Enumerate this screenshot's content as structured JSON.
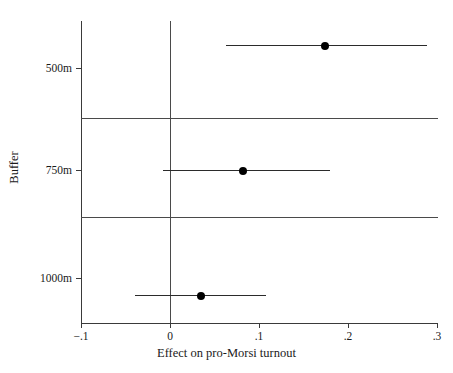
{
  "figure": {
    "cut_off_header_left": "",
    "cut_off_header_right": ""
  },
  "chart_data": {
    "type": "scatter",
    "subtype": "coefficient-plot-with-confidence-intervals",
    "orientation": "horizontal",
    "title": "",
    "xlabel": "Effect on pro-Morsi turnout",
    "ylabel": "Buffer",
    "categories": [
      "500m",
      "750m",
      "1000m"
    ],
    "xlim": [
      -0.1,
      0.3
    ],
    "xticks": [
      -0.1,
      0,
      0.1,
      0.2,
      0.3
    ],
    "xticklabels": [
      "−.1",
      "0",
      ".1",
      ".2",
      ".3"
    ],
    "yticklabels": [
      "500m",
      "750m",
      "1000m"
    ],
    "grid": false,
    "legend": "none",
    "reference_line": 0,
    "points": [
      {
        "category": "500m",
        "estimate": 0.174,
        "ci_low": 0.063,
        "ci_high": 0.289
      },
      {
        "category": "750m",
        "estimate": 0.082,
        "ci_low": -0.008,
        "ci_high": 0.18
      },
      {
        "category": "1000m",
        "estimate": 0.035,
        "ci_low": -0.039,
        "ci_high": 0.108
      }
    ],
    "colors": {
      "marker": "#000000",
      "interval": "#2b2b2b",
      "axis": "#3a3a3a",
      "reference": "#4a4a4a",
      "background": "#ffffff"
    }
  }
}
